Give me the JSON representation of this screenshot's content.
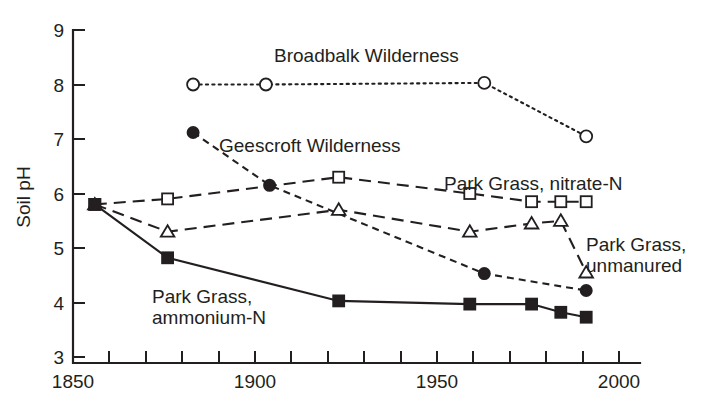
{
  "chart_data": {
    "type": "line",
    "title": "",
    "xlabel": "",
    "ylabel": "Soil pH",
    "xlim": [
      1850,
      2000
    ],
    "ylim": [
      3,
      9
    ],
    "x_ticks_major": [
      1850,
      1900,
      1950,
      2000
    ],
    "x_ticks_minor_interval": 10,
    "y_ticks": [
      3,
      4,
      5,
      6,
      7,
      8,
      9
    ],
    "grid": false,
    "legend": "inline annotations",
    "series": [
      {
        "name": "Broadbalk Wilderness",
        "marker": "open-circle",
        "linestyle": "dotted",
        "label_position": "top-center",
        "x": [
          1883,
          1903,
          1963,
          1991
        ],
        "values": [
          8.0,
          8.0,
          8.03,
          7.05
        ]
      },
      {
        "name": "Geescroft Wilderness",
        "marker": "filled-circle",
        "linestyle": "short-dash",
        "label_position": "upper-left",
        "x": [
          1883,
          1904,
          1963,
          1991
        ],
        "values": [
          7.12,
          6.15,
          4.53,
          4.22
        ]
      },
      {
        "name": "Park Grass, nitrate-N",
        "marker": "open-square",
        "linestyle": "long-dash",
        "label_position": "mid-right",
        "x": [
          1856,
          1876,
          1923,
          1959,
          1976,
          1984,
          1991
        ],
        "values": [
          5.8,
          5.9,
          6.3,
          6.0,
          5.85,
          5.85,
          5.85
        ]
      },
      {
        "name": "Park Grass, unmanured",
        "marker": "open-triangle",
        "linestyle": "long-dash",
        "label_position": "lower-right",
        "x": [
          1856,
          1876,
          1923,
          1959,
          1976,
          1984,
          1991
        ],
        "values": [
          5.8,
          5.3,
          5.7,
          5.3,
          5.45,
          5.5,
          4.55
        ]
      },
      {
        "name": "Park Grass, ammonium-N",
        "marker": "filled-square",
        "linestyle": "solid",
        "label_position": "lower-left",
        "x": [
          1856,
          1876,
          1923,
          1959,
          1976,
          1984,
          1991
        ],
        "values": [
          5.8,
          4.82,
          4.03,
          3.97,
          3.97,
          3.82,
          3.73
        ]
      }
    ]
  },
  "axes": {
    "y_title": "Soil pH",
    "y_tick_labels": [
      "9",
      "8",
      "7",
      "6",
      "5",
      "4",
      "3"
    ],
    "x_tick_labels": [
      "1850",
      "1900",
      "1950",
      "2000"
    ]
  },
  "annotations": {
    "broadbalk": "Broadbalk Wilderness",
    "geescroft": "Geescroft Wilderness",
    "nitrate": "Park Grass, nitrate-N",
    "unmanured_line1": "Park Grass,",
    "unmanured_line2": "unmanured",
    "ammonium_line1": "Park Grass,",
    "ammonium_line2": "ammonium-N"
  },
  "colors": {
    "ink": "#231f20",
    "background": "#ffffff"
  }
}
